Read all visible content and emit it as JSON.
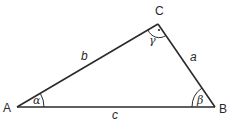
{
  "diagram": {
    "type": "triangle",
    "vertices": {
      "A": {
        "label": "A",
        "x": 17,
        "y": 107
      },
      "B": {
        "label": "B",
        "x": 215,
        "y": 107
      },
      "C": {
        "label": "C",
        "x": 158,
        "y": 24
      }
    },
    "sides": {
      "a": {
        "label": "a"
      },
      "b": {
        "label": "b"
      },
      "c": {
        "label": "c"
      }
    },
    "angles": {
      "alpha": {
        "label": "α"
      },
      "beta": {
        "label": "β"
      },
      "gamma": {
        "label": "γ",
        "right_angle_dot": true
      }
    },
    "colors": {
      "stroke": "#2a2a2a",
      "background": "#ffffff"
    }
  }
}
